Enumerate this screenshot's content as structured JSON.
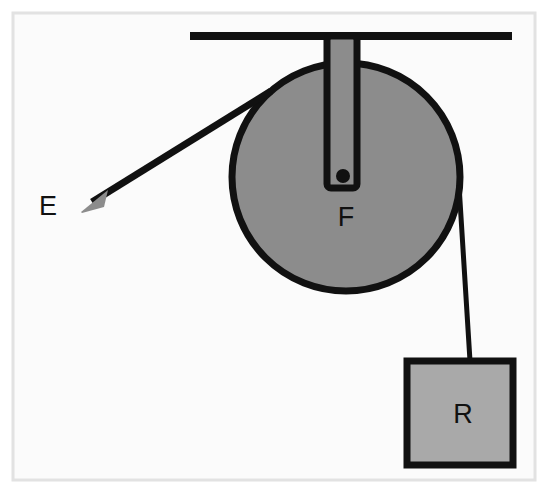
{
  "figure": {
    "canvas": {
      "width": 554,
      "height": 494
    },
    "background_color": "#ffffff",
    "frame": {
      "name": "image-border",
      "x": 13,
      "y": 13,
      "width": 522,
      "height": 467,
      "fill": "#fbfbfb",
      "stroke": "#e2e2e2",
      "stroke_width": 3
    },
    "colors": {
      "ink": "#111111",
      "pulley_fill": "#8c8c8c",
      "bracket_fill": "#8c8c8c",
      "block_fill": "#a9a9a9",
      "arrowhead_fill": "#8c8c8c",
      "paper": "#fbfbfb"
    },
    "ceiling_bar": {
      "name": "ceiling-support-bar",
      "x1": 190,
      "y1": 36,
      "x2": 512,
      "y2": 36,
      "stroke_width": 8
    },
    "bracket": {
      "name": "pulley-mount-bracket",
      "x": 327,
      "y": 36,
      "width": 30,
      "height": 152,
      "stroke_width": 7,
      "corner_radius": 4
    },
    "pulley": {
      "name": "pulley-wheel",
      "cx": 346,
      "cy": 177,
      "r": 114,
      "stroke_width": 7
    },
    "axle": {
      "name": "pulley-axle-dot",
      "cx": 343,
      "cy": 176,
      "r": 7
    },
    "effort_rope": {
      "name": "effort-rope",
      "x1": 271,
      "y1": 91,
      "x2": 92,
      "y2": 202,
      "stroke_width": 7
    },
    "effort_arrowhead": {
      "name": "effort-force-arrowhead",
      "points": "81,212 108,190 104,207 82,213",
      "tip_x": 78,
      "tip_y": 214
    },
    "load_rope": {
      "name": "load-rope",
      "x1": 459,
      "y1": 185,
      "x2": 470,
      "y2": 361,
      "stroke_width": 5
    },
    "load_block": {
      "name": "load-block",
      "x": 407,
      "y": 361,
      "width": 106,
      "height": 104,
      "stroke_width": 7
    },
    "labels": [
      {
        "name": "label-effort",
        "text": "E",
        "x": 48,
        "y": 215,
        "anchor": "middle"
      },
      {
        "name": "label-fulcrum",
        "text": "F",
        "x": 346,
        "y": 226,
        "anchor": "middle"
      },
      {
        "name": "label-resistance",
        "text": "R",
        "x": 463,
        "y": 423,
        "anchor": "middle"
      }
    ],
    "legend": {
      "effort": "E",
      "fulcrum": "F",
      "resistance": "R"
    }
  }
}
